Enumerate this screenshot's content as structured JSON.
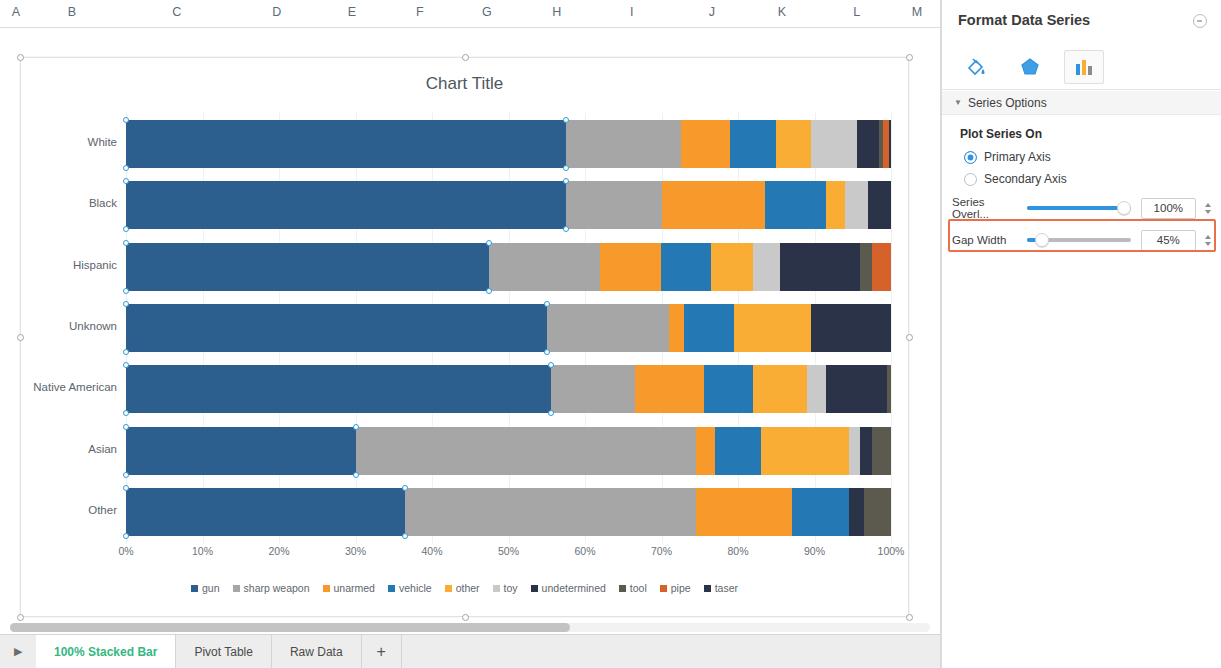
{
  "spreadsheet": {
    "column_headers": [
      "A",
      "B",
      "C",
      "D",
      "E",
      "F",
      "G",
      "H",
      "I",
      "J",
      "K",
      "L",
      "M"
    ],
    "tabs": [
      {
        "label": "100% Stacked Bar",
        "active": true
      },
      {
        "label": "Pivot Table",
        "active": false
      },
      {
        "label": "Raw Data",
        "active": false
      }
    ],
    "add_sheet_label": "+",
    "sheet_nav_arrow": "▶"
  },
  "panel": {
    "title": "Format Data Series",
    "close_icon": "close-icon",
    "tabs": [
      {
        "icon": "paint-bucket-icon",
        "active": false
      },
      {
        "icon": "pentagon-effects-icon",
        "active": false
      },
      {
        "icon": "series-chart-icon",
        "active": true
      }
    ],
    "section": {
      "caret": "▼",
      "label": "Series Options"
    },
    "plot_series_on_label": "Plot Series On",
    "radios": [
      {
        "label": "Primary Axis",
        "selected": true
      },
      {
        "label": "Secondary Axis",
        "selected": false
      }
    ],
    "controls": [
      {
        "label": "Series Overl...",
        "value": "100%",
        "fill_pct": 100,
        "highlighted": false
      },
      {
        "label": "Gap Width",
        "value": "45%",
        "fill_pct": 8,
        "highlighted": true
      }
    ],
    "highlight_color": "#e8714a",
    "accent_color": "#2f93e0"
  },
  "chart_data": {
    "type": "bar",
    "orientation": "horizontal",
    "stacked": "100%",
    "title": "Chart Title",
    "xlabel": "",
    "ylabel": "",
    "xlim": [
      0,
      100
    ],
    "grid": true,
    "legend_position": "bottom",
    "xticks": [
      "0%",
      "10%",
      "20%",
      "30%",
      "40%",
      "50%",
      "60%",
      "70%",
      "80%",
      "90%",
      "100%"
    ],
    "categories": [
      "White",
      "Black",
      "Hispanic",
      "Unknown",
      "Native American",
      "Asian",
      "Other"
    ],
    "series": [
      {
        "name": "gun",
        "color": "#2c5f8e",
        "values": [
          57.5,
          57.5,
          47.5,
          55.0,
          55.5,
          30.0,
          36.5
        ]
      },
      {
        "name": "sharp weapon",
        "color": "#a6a6a6",
        "values": [
          15.0,
          12.5,
          14.5,
          16.0,
          11.0,
          44.5,
          38.0
        ]
      },
      {
        "name": "unarmed",
        "color": "#f79a2b",
        "values": [
          6.5,
          13.5,
          8.0,
          2.0,
          9.0,
          2.5,
          12.5
        ]
      },
      {
        "name": "vehicle",
        "color": "#2479b5",
        "values": [
          6.0,
          8.0,
          6.5,
          6.5,
          6.5,
          6.0,
          7.5
        ]
      },
      {
        "name": "other",
        "color": "#f9ad35",
        "values": [
          4.5,
          2.5,
          5.5,
          10.0,
          7.0,
          11.5,
          0.0
        ]
      },
      {
        "name": "toy",
        "color": "#c9c9c9",
        "values": [
          6.0,
          3.0,
          3.5,
          0.0,
          2.5,
          1.5,
          0.0
        ]
      },
      {
        "name": "undetermined",
        "color": "#2b3348",
        "values": [
          3.0,
          3.0,
          10.5,
          10.5,
          8.0,
          1.5,
          2.0
        ]
      },
      {
        "name": "tool",
        "color": "#5c5a4e",
        "values": [
          0.5,
          0.0,
          1.5,
          0.0,
          0.5,
          2.5,
          3.5
        ]
      },
      {
        "name": "pipe",
        "color": "#d4622a",
        "values": [
          0.7,
          0.0,
          2.5,
          0.0,
          0.0,
          0.0,
          0.0
        ]
      },
      {
        "name": "taser",
        "color": "#2b3348",
        "values": [
          0.3,
          0.0,
          0.0,
          0.0,
          0.0,
          0.0,
          0.0
        ]
      }
    ]
  }
}
